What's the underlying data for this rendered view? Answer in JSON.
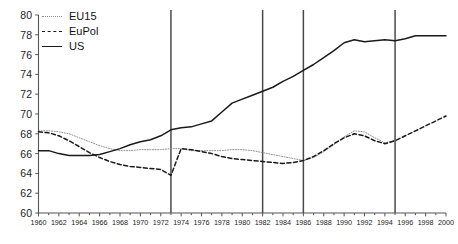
{
  "chart_data": {
    "type": "line",
    "title": "",
    "subtitle": "",
    "xlabel": "",
    "ylabel": "",
    "xlim": [
      1960,
      2000
    ],
    "ylim": [
      60,
      80
    ],
    "ytick_step": 2,
    "xtick_step": 2,
    "x_minor_step": 1,
    "grid": false,
    "legend_position": "top-left",
    "yticks": [
      60,
      62,
      64,
      66,
      68,
      70,
      72,
      74,
      76,
      78,
      80
    ],
    "xticks": [
      1960,
      1962,
      1964,
      1966,
      1968,
      1970,
      1972,
      1974,
      1976,
      1978,
      1980,
      1982,
      1984,
      1986,
      1988,
      1990,
      1992,
      1994,
      1996,
      1998,
      2000
    ],
    "annotations": {
      "vertical_reference_lines": [
        1973,
        1982,
        1986,
        1995
      ]
    },
    "series": [
      {
        "name": "EU15",
        "style": "dotted-thin",
        "color": "#8c8c8c",
        "x": [
          1960,
          1961,
          1962,
          1963,
          1964,
          1965,
          1966,
          1967,
          1968,
          1969,
          1970,
          1971,
          1972,
          1973,
          1974,
          1975,
          1976,
          1977,
          1978,
          1979,
          1980,
          1981,
          1982,
          1983,
          1984,
          1985,
          1986,
          1987,
          1988,
          1989,
          1990,
          1991,
          1992,
          1993,
          1994,
          1995
        ],
        "values": [
          68.3,
          68.3,
          68.2,
          68.0,
          67.6,
          67.2,
          66.8,
          66.5,
          66.3,
          66.3,
          66.4,
          66.4,
          66.4,
          66.5,
          66.5,
          66.3,
          66.3,
          66.3,
          66.3,
          66.4,
          66.4,
          66.3,
          66.1,
          65.9,
          65.7,
          65.5,
          65.3,
          65.6,
          66.2,
          66.9,
          67.7,
          68.3,
          68.2,
          67.6,
          67.1,
          67.3
        ]
      },
      {
        "name": "EuPol",
        "style": "dashed",
        "color": "#1a1a1a",
        "x": [
          1960,
          1961,
          1962,
          1963,
          1964,
          1965,
          1966,
          1967,
          1968,
          1969,
          1970,
          1971,
          1972,
          1973,
          1974,
          1975,
          1976,
          1977,
          1978,
          1979,
          1980,
          1981,
          1982,
          1983,
          1984,
          1985,
          1986,
          1987,
          1988,
          1989,
          1990,
          1991,
          1992,
          1993,
          1994,
          1995,
          1996,
          1997,
          1998,
          1999,
          2000
        ],
        "values": [
          68.2,
          68.1,
          67.8,
          67.3,
          66.7,
          66.1,
          65.6,
          65.2,
          64.9,
          64.7,
          64.6,
          64.5,
          64.4,
          63.8,
          66.5,
          66.4,
          66.2,
          66.0,
          65.7,
          65.5,
          65.4,
          65.3,
          65.2,
          65.1,
          65.0,
          65.1,
          65.3,
          65.7,
          66.3,
          67.0,
          67.6,
          68.0,
          67.8,
          67.3,
          67.0,
          67.3,
          67.8,
          68.3,
          68.8,
          69.3,
          69.8
        ]
      },
      {
        "name": "US",
        "style": "solid",
        "color": "#1a1a1a",
        "x": [
          1960,
          1961,
          1962,
          1963,
          1964,
          1965,
          1966,
          1967,
          1968,
          1969,
          1970,
          1971,
          1972,
          1973,
          1974,
          1975,
          1976,
          1977,
          1978,
          1979,
          1980,
          1981,
          1982,
          1983,
          1984,
          1985,
          1986,
          1987,
          1988,
          1989,
          1990,
          1991,
          1992,
          1993,
          1994,
          1995,
          1996,
          1997,
          1998,
          1999,
          2000
        ],
        "values": [
          66.3,
          66.3,
          66.0,
          65.8,
          65.8,
          65.8,
          65.9,
          66.2,
          66.5,
          66.9,
          67.2,
          67.4,
          67.8,
          68.4,
          68.6,
          68.7,
          69.0,
          69.3,
          70.2,
          71.1,
          71.5,
          71.9,
          72.3,
          72.7,
          73.3,
          73.8,
          74.4,
          75.0,
          75.7,
          76.4,
          77.2,
          77.5,
          77.3,
          77.4,
          77.5,
          77.4,
          77.6,
          77.9,
          77.9,
          77.9,
          77.9
        ]
      }
    ]
  },
  "legend": {
    "items": [
      {
        "label": "EU15"
      },
      {
        "label": "EuPol"
      },
      {
        "label": "US"
      }
    ]
  }
}
